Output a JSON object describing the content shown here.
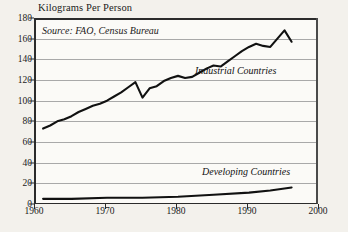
{
  "chart_data": {
    "type": "line",
    "title": "Kilograms Per Person",
    "xlabel": "",
    "ylabel": "",
    "source_note": "Source: FAO, Census Bureau",
    "grid": true,
    "legend_position": "inline-annotation",
    "xlim": [
      1960,
      2000
    ],
    "ylim": [
      0,
      180
    ],
    "yticks": [
      0,
      20,
      40,
      60,
      80,
      100,
      120,
      140,
      160,
      180
    ],
    "xticks": [
      1960,
      1970,
      1980,
      1990,
      2000
    ],
    "series": [
      {
        "name": "Industrial Countries",
        "x": [
          1961,
          1962,
          1963,
          1964,
          1965,
          1966,
          1967,
          1968,
          1969,
          1970,
          1971,
          1972,
          1973,
          1974,
          1975,
          1976,
          1977,
          1978,
          1979,
          1980,
          1981,
          1982,
          1983,
          1984,
          1985,
          1986,
          1987,
          1988,
          1989,
          1990,
          1991,
          1992,
          1993,
          1994,
          1995,
          1996
        ],
        "values": [
          73,
          76,
          80,
          82,
          85,
          89,
          92,
          95,
          97,
          100,
          104,
          108,
          113,
          118,
          103,
          112,
          114,
          119,
          122,
          124,
          122,
          123,
          127,
          131,
          134,
          133,
          138,
          143,
          148,
          152,
          155,
          153,
          152,
          160,
          168,
          157
        ]
      },
      {
        "name": "Developing Countries",
        "x": [
          1961,
          1965,
          1970,
          1975,
          1980,
          1985,
          1990,
          1993,
          1995,
          1996
        ],
        "values": [
          5,
          5,
          6,
          6,
          7,
          9,
          11,
          13,
          15,
          16
        ]
      }
    ]
  },
  "annotations": {
    "industrial_label": "Industrial Countries",
    "developing_label": "Developing Countries"
  },
  "colors": {
    "line": "#111111",
    "grid": "#a9a9a9",
    "axis": "#2b2b2b",
    "plot_background": "#fbfaf7",
    "page_background": "#f3f1ec"
  }
}
